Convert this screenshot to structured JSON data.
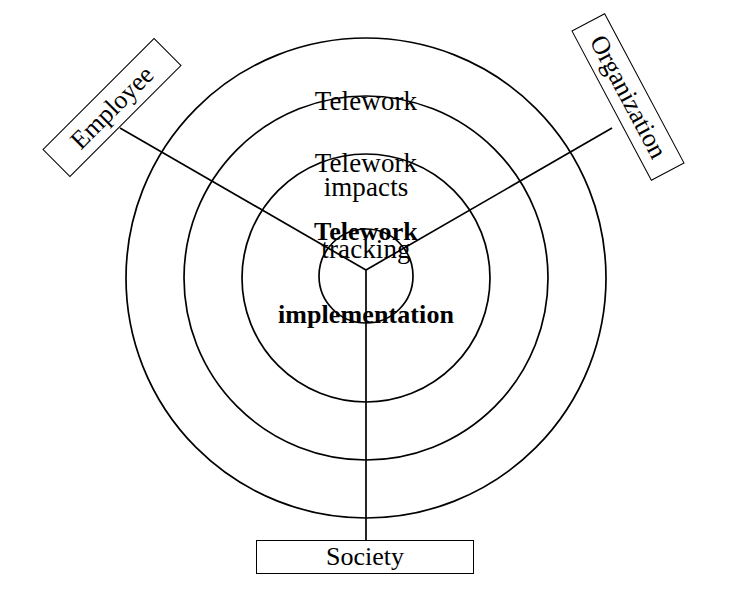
{
  "diagram": {
    "center_hub": {
      "name": "hub",
      "radius": 47
    },
    "rings": [
      {
        "id": "ring-outer",
        "radius": 240,
        "label": "",
        "bold": false
      },
      {
        "id": "ring-impacts",
        "radius": 182,
        "label": "Telework\nimpacts",
        "bold": false
      },
      {
        "id": "ring-tracking",
        "radius": 124,
        "label": "Telework\ntracking",
        "bold": false
      },
      {
        "id": "ring-implementation",
        "radius": 47,
        "label": "Telework\nimplementation",
        "bold": true
      }
    ],
    "ring_labels": {
      "impacts_line1": "Telework",
      "impacts_line2": "impacts",
      "tracking_line1": "Telework",
      "tracking_line2": "tracking",
      "implementation_line1": "Telework",
      "implementation_line2": "implementation"
    },
    "nodes": [
      {
        "id": "employee",
        "label": "Employee",
        "rotation_deg": -45,
        "position": "upper-left"
      },
      {
        "id": "organization",
        "label": "Organization",
        "rotation_deg": 62,
        "position": "upper-right"
      },
      {
        "id": "society",
        "label": "Society",
        "rotation_deg": 0,
        "position": "bottom"
      }
    ],
    "spokes": [
      {
        "id": "spoke-employee",
        "angle_deg": 150,
        "to": "employee"
      },
      {
        "id": "spoke-organization",
        "angle_deg": 30,
        "to": "organization"
      },
      {
        "id": "spoke-society",
        "angle_deg": 270,
        "to": "society"
      }
    ],
    "colors": {
      "stroke": "#000000",
      "background": "#ffffff",
      "text": "#000000"
    }
  }
}
